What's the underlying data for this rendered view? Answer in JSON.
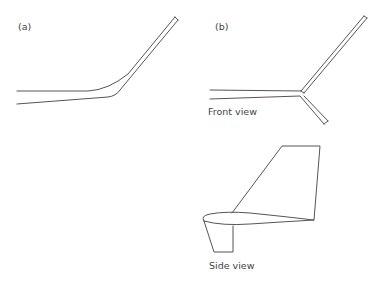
{
  "panel_a": {
    "label": "(a)"
  },
  "panel_b": {
    "label": "(b)",
    "front_caption": "Front view",
    "side_caption": "Side view"
  },
  "colors": {
    "stroke": "#555555",
    "text": "#444444",
    "background": "#ffffff"
  }
}
